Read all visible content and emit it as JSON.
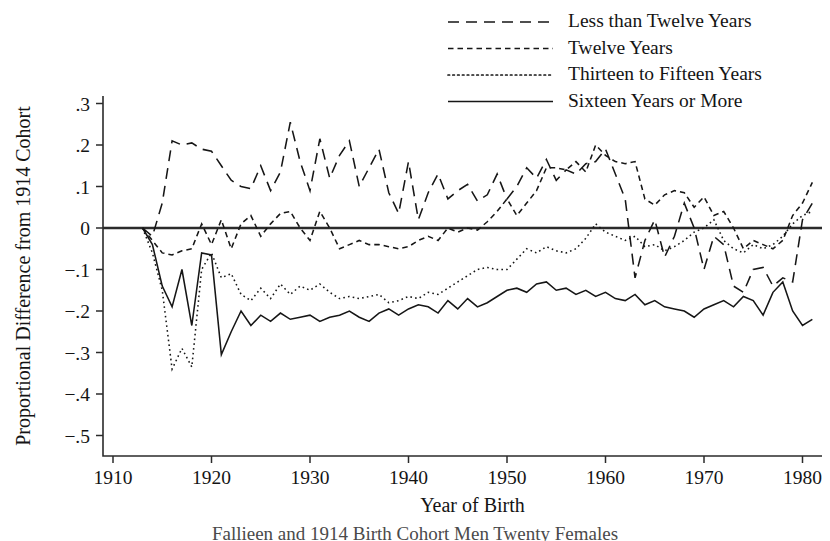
{
  "figure": {
    "caption_partial": "Fallieen and 1914 Birth Cohort Men Twenty Females"
  },
  "axes": {
    "x_title": "Year of Birth",
    "y_title": "Proportional Difference from 1914 Cohort",
    "x_ticks": [
      "1910",
      "1920",
      "1930",
      "1940",
      "1950",
      "1960",
      "1970",
      "1980"
    ],
    "y_ticks": [
      ".3",
      ".2",
      ".1",
      "0",
      "−.1",
      "−.2",
      "−.3",
      "−.4",
      "−.5"
    ]
  },
  "legend": {
    "items": [
      {
        "label": "Less than Twelve Years",
        "style": "long-dash",
        "dasharray": "11,7"
      },
      {
        "label": "Twelve Years",
        "style": "dash",
        "dasharray": "5.5,4"
      },
      {
        "label": "Thirteen to Fifteen Years",
        "style": "dotted",
        "dasharray": "1.6,3.2"
      },
      {
        "label": "Sixteen Years or More",
        "style": "solid",
        "dasharray": "none"
      }
    ]
  },
  "chart_data": {
    "type": "line",
    "title": "",
    "xlabel": "Year of Birth",
    "ylabel": "Proportional Difference from 1914 Cohort",
    "xlim": [
      1908,
      1983
    ],
    "ylim": [
      -0.55,
      0.33
    ],
    "grid": false,
    "legend_position": "top-right",
    "zero_reference_line": 0,
    "x": [
      1913,
      1914,
      1915,
      1916,
      1917,
      1918,
      1919,
      1920,
      1921,
      1922,
      1923,
      1924,
      1925,
      1926,
      1927,
      1928,
      1929,
      1930,
      1931,
      1932,
      1933,
      1934,
      1935,
      1936,
      1937,
      1938,
      1939,
      1940,
      1941,
      1942,
      1943,
      1944,
      1945,
      1946,
      1947,
      1948,
      1949,
      1950,
      1951,
      1952,
      1953,
      1954,
      1955,
      1956,
      1957,
      1958,
      1959,
      1960,
      1961,
      1962,
      1963,
      1964,
      1965,
      1966,
      1967,
      1968,
      1969,
      1970,
      1971,
      1972,
      1973,
      1974,
      1975,
      1976,
      1977,
      1978,
      1979,
      1980,
      1981
    ],
    "series": [
      {
        "name": "Less than Twelve Years",
        "style": "long-dash",
        "values": [
          0.0,
          -0.02,
          0.06,
          0.21,
          0.2,
          0.205,
          0.19,
          0.185,
          0.15,
          0.115,
          0.1,
          0.095,
          0.15,
          0.09,
          0.135,
          0.255,
          0.16,
          0.09,
          0.215,
          0.12,
          0.175,
          0.21,
          0.1,
          0.145,
          0.19,
          0.085,
          0.035,
          0.16,
          0.02,
          0.085,
          0.13,
          0.07,
          0.09,
          0.105,
          0.065,
          0.08,
          0.13,
          0.07,
          0.1,
          0.145,
          0.12,
          0.165,
          0.115,
          0.14,
          0.13,
          0.155,
          0.16,
          0.19,
          0.13,
          0.07,
          -0.12,
          -0.03,
          0.02,
          -0.07,
          -0.02,
          0.06,
          0.0,
          -0.1,
          -0.02,
          -0.04,
          -0.14,
          -0.155,
          -0.1,
          -0.095,
          -0.14,
          -0.12,
          -0.13,
          0.02,
          0.06
        ]
      },
      {
        "name": "Twelve Years",
        "style": "dash",
        "values": [
          0.0,
          -0.03,
          -0.06,
          -0.065,
          -0.055,
          -0.05,
          0.01,
          -0.04,
          0.02,
          -0.05,
          0.01,
          0.03,
          -0.02,
          0.01,
          0.035,
          0.04,
          0.0,
          -0.03,
          0.04,
          0.0,
          -0.05,
          -0.04,
          -0.03,
          -0.04,
          -0.04,
          -0.045,
          -0.05,
          -0.045,
          -0.03,
          -0.02,
          -0.03,
          0.0,
          -0.01,
          0.0,
          -0.005,
          0.015,
          0.04,
          0.07,
          0.03,
          0.06,
          0.09,
          0.145,
          0.145,
          0.14,
          0.16,
          0.135,
          0.2,
          0.175,
          0.16,
          0.155,
          0.16,
          0.07,
          0.055,
          0.08,
          0.09,
          0.085,
          0.05,
          0.075,
          0.03,
          0.04,
          0.0,
          -0.05,
          -0.03,
          -0.04,
          -0.05,
          -0.03,
          0.03,
          0.06,
          0.11
        ]
      },
      {
        "name": "Thirteen to Fifteen Years",
        "style": "dotted",
        "values": [
          0.0,
          -0.06,
          -0.15,
          -0.34,
          -0.29,
          -0.335,
          -0.1,
          -0.06,
          -0.12,
          -0.11,
          -0.16,
          -0.175,
          -0.145,
          -0.17,
          -0.135,
          -0.16,
          -0.14,
          -0.15,
          -0.135,
          -0.155,
          -0.17,
          -0.165,
          -0.17,
          -0.165,
          -0.16,
          -0.18,
          -0.175,
          -0.165,
          -0.17,
          -0.155,
          -0.16,
          -0.145,
          -0.13,
          -0.115,
          -0.1,
          -0.095,
          -0.1,
          -0.1,
          -0.075,
          -0.05,
          -0.06,
          -0.045,
          -0.055,
          -0.06,
          -0.05,
          -0.025,
          0.01,
          -0.01,
          -0.02,
          -0.03,
          -0.02,
          -0.045,
          -0.04,
          -0.055,
          -0.045,
          -0.03,
          -0.01,
          0.0,
          0.02,
          -0.03,
          -0.05,
          -0.06,
          -0.04,
          -0.05,
          -0.04,
          -0.02,
          0.01,
          0.03,
          0.04
        ]
      },
      {
        "name": "Sixteen Years or More",
        "style": "solid",
        "values": [
          0.0,
          -0.04,
          -0.14,
          -0.19,
          -0.1,
          -0.235,
          -0.06,
          -0.065,
          -0.305,
          -0.25,
          -0.2,
          -0.235,
          -0.21,
          -0.225,
          -0.205,
          -0.22,
          -0.215,
          -0.21,
          -0.225,
          -0.215,
          -0.21,
          -0.2,
          -0.215,
          -0.225,
          -0.205,
          -0.195,
          -0.21,
          -0.195,
          -0.185,
          -0.19,
          -0.205,
          -0.175,
          -0.195,
          -0.17,
          -0.19,
          -0.18,
          -0.165,
          -0.15,
          -0.145,
          -0.155,
          -0.135,
          -0.13,
          -0.15,
          -0.145,
          -0.16,
          -0.15,
          -0.165,
          -0.155,
          -0.17,
          -0.175,
          -0.16,
          -0.185,
          -0.175,
          -0.19,
          -0.195,
          -0.2,
          -0.215,
          -0.195,
          -0.185,
          -0.175,
          -0.19,
          -0.165,
          -0.175,
          -0.21,
          -0.155,
          -0.13,
          -0.2,
          -0.235,
          -0.22
        ]
      }
    ]
  }
}
